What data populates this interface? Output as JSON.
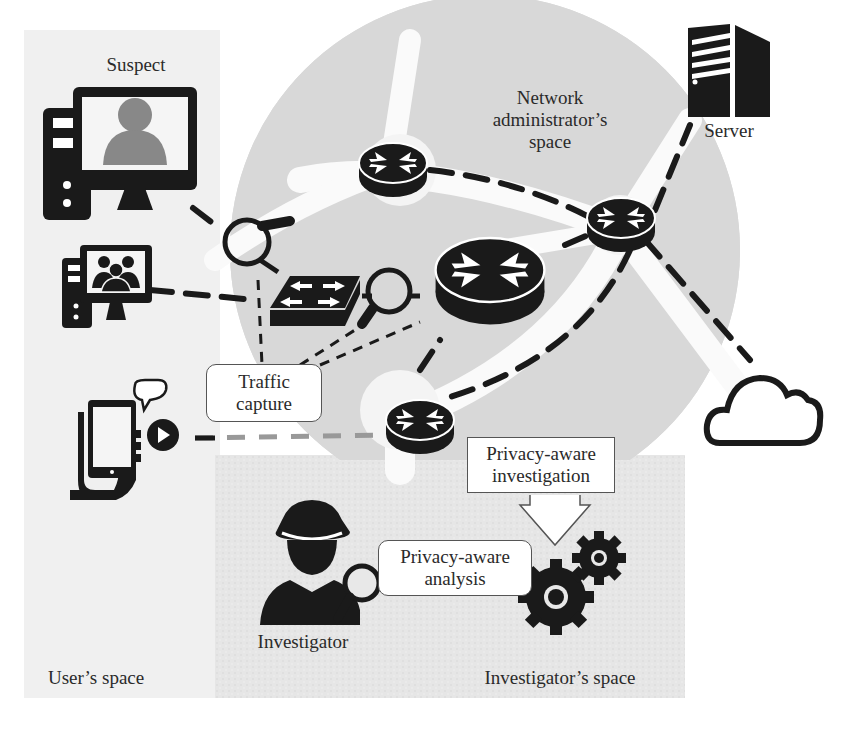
{
  "diagram": {
    "regions": {
      "users_space": "User’s space",
      "network_admin_space": [
        "Network",
        "administrator’s",
        "space"
      ],
      "investigators_space": "Investigator’s space"
    },
    "actors": {
      "suspect": "Suspect",
      "server": "Server",
      "investigator": "Investigator"
    },
    "process_boxes": {
      "traffic_capture": [
        "Traffic",
        "capture"
      ],
      "privacy_aware_investigation": [
        "Privacy-aware",
        "investigation"
      ],
      "privacy_aware_analysis": [
        "Privacy-aware",
        "analysis"
      ]
    },
    "icons": [
      "suspect-desktop-computer-icon",
      "group-desktop-computer-icon",
      "mobile-phone-hand-icon",
      "magnifier-icon",
      "switch-icon",
      "router-icon",
      "server-icon",
      "cloud-icon",
      "investigator-spy-icon",
      "gears-icon",
      "down-arrow-icon"
    ],
    "colors": {
      "users_space_bg": "#f0f0f0",
      "network_space_bg": "#d6d6d6",
      "investigator_space_bg": "#e8e8e8",
      "icon_fill": "#1a1a1a",
      "link_dash": "#1a1a1a"
    }
  }
}
